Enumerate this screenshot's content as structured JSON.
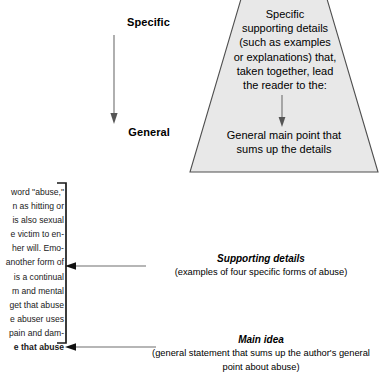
{
  "diagram": {
    "axis": {
      "top_label": "Specific",
      "bottom_label": "General",
      "arrow_name": "downward-arrow"
    },
    "pyramid": {
      "top_text": "Specific\nsupporting details\n(such as examples\nor explanations) that,\ntaken together, lead\nthe reader to the:",
      "top_lines": [
        "Specific",
        "supporting details",
        "(such as examples",
        "or explanations) that,",
        "taken together, lead",
        "the reader to the:"
      ],
      "bottom_lines": [
        "General main point that",
        "sums up the details"
      ],
      "fill_color": "#e8e8e8",
      "border_color": "#555555"
    },
    "excerpt": {
      "lines": [
        {
          "text": "word \"abuse,\"",
          "bold": false
        },
        {
          "text": "n as hitting or",
          "bold": false
        },
        {
          "text": "is also sexual",
          "bold": false,
          "italic_tail": "sexual"
        },
        {
          "text": "e victim to en-",
          "bold": false
        },
        {
          "text": "her will. Emo-",
          "bold": false,
          "italic_tail": "Emo-"
        },
        {
          "text": "another form of",
          "bold": false
        },
        {
          "text": "is a continual",
          "bold": false
        },
        {
          "text": "m and mental",
          "bold": false
        },
        {
          "text": "get that abuse",
          "bold": false
        },
        {
          "text": "e abuser uses",
          "bold": false
        },
        {
          "text": "pain and dam-",
          "bold": false
        },
        {
          "text": "e that abuse",
          "bold": true
        }
      ]
    },
    "callouts": {
      "supporting": {
        "title": "Supporting details",
        "subtitle": "(examples of four specific forms of abuse)"
      },
      "main_idea": {
        "title": "Main idea",
        "subtitle_line1": "(general statement that sums up the author's general",
        "subtitle_line2": "point about abuse)"
      }
    }
  }
}
